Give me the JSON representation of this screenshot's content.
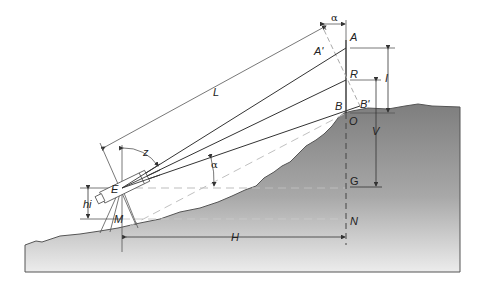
{
  "figure": {
    "title": "",
    "colors": {
      "terrain_dark": "#8c8c8c",
      "terrain_light": "#e6e6e6",
      "line": "#333333",
      "dashed": "#b0b0b0",
      "background": "#ffffff"
    }
  },
  "points": {
    "A": "A",
    "A_prime": "A'",
    "R": "R",
    "B": "B",
    "B_prime": "B'",
    "O": "O",
    "G": "G",
    "N": "N",
    "E": "E",
    "M": "M"
  },
  "dimensions": {
    "L": "L",
    "I": "I",
    "V": "V",
    "H": "H",
    "hi": "hi",
    "z": "z",
    "alpha_top": "α",
    "alpha_mid": "α"
  },
  "icons": {
    "instrument": "theodolite-icon",
    "staff": "levelling-staff"
  }
}
